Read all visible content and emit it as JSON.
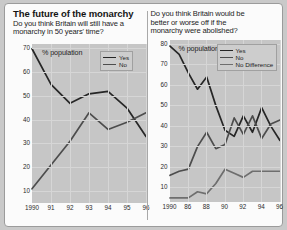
{
  "charts": {
    "left": {
      "title": "The future of the monarchy",
      "question": "Do you think Britain will still have a\nmonarchy in 50 years' time?",
      "axis_note": "% population",
      "legend": [
        {
          "label": "Yes",
          "color": "#262626"
        },
        {
          "label": "No",
          "color": "#4d4d4d"
        }
      ]
    },
    "right": {
      "title": "",
      "question": "Do you think Britain would be\nbetter or  worse off if the\nmonarchy were abolished?",
      "axis_note": "% population",
      "legend": [
        {
          "label": "Yes",
          "color": "#262626"
        },
        {
          "label": "No",
          "color": "#4d4d4d"
        },
        {
          "label": "No Difference",
          "color": "#6e6e6e"
        }
      ]
    }
  },
  "chart_data": [
    {
      "id": "left",
      "type": "line",
      "title": "The future of the monarchy",
      "subtitle": "Do you think Britain will still have a monarchy in 50 years' time?",
      "xlabel": "",
      "ylabel": "% population",
      "x": [
        1990,
        1991,
        1992,
        1993,
        1994,
        1995,
        1996
      ],
      "xtick_labels": [
        "1990",
        "91",
        "92",
        "93",
        "94",
        "95",
        "96"
      ],
      "ytick_labels": [
        "10",
        "20",
        "30",
        "40",
        "50",
        "60",
        "70"
      ],
      "yticks": [
        10,
        20,
        30,
        40,
        50,
        60,
        70
      ],
      "ylim": [
        5,
        72
      ],
      "grid": true,
      "legend_position": "top-right",
      "series": [
        {
          "name": "Yes",
          "color": "#262626",
          "values": [
            70,
            55,
            47,
            51,
            52,
            45,
            33
          ]
        },
        {
          "name": "No",
          "color": "#4d4d4d",
          "values": [
            11,
            21,
            31,
            43,
            36,
            39,
            43
          ]
        }
      ]
    },
    {
      "id": "right",
      "type": "line",
      "title": "",
      "subtitle": "Do you think Britain would be better or worse off if the monarchy were abolished?",
      "xlabel": "",
      "ylabel": "% population",
      "x": [
        1984,
        1986,
        1988,
        1990,
        1992,
        1994,
        1996
      ],
      "xtick_labels": [
        "1990",
        "86",
        "88",
        "90",
        "92",
        "94",
        "96"
      ],
      "ytick_labels": [
        "10",
        "20",
        "30",
        "40",
        "50",
        "60",
        "70",
        "80"
      ],
      "yticks": [
        10,
        20,
        30,
        40,
        50,
        60,
        70,
        80
      ],
      "ylim": [
        3,
        82
      ],
      "grid": true,
      "legend_position": "top-right",
      "series": [
        {
          "name": "Yes",
          "color": "#262626",
          "values": [
            79,
            75,
            66,
            58,
            64,
            50,
            38,
            35,
            45,
            37,
            49,
            40,
            33
          ]
        },
        {
          "name": "No",
          "color": "#4d4d4d",
          "values": [
            16,
            18,
            19,
            30,
            37,
            29,
            31,
            44,
            36,
            45,
            34,
            41,
            43
          ]
        },
        {
          "name": "No Difference",
          "color": "#6e6e6e",
          "values": [
            5,
            5,
            5,
            8,
            7,
            12,
            19,
            17,
            15,
            18,
            18,
            18,
            18
          ]
        }
      ]
    }
  ]
}
